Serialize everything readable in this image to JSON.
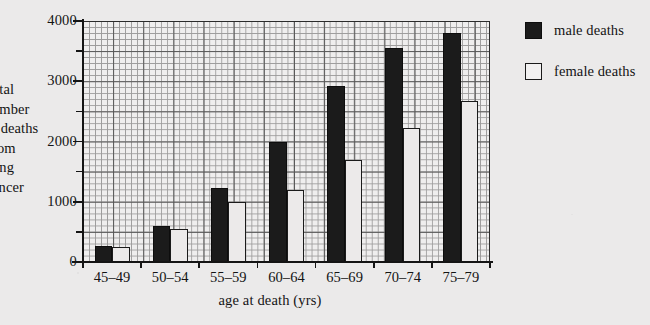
{
  "chart_data": {
    "type": "bar",
    "title": "",
    "xlabel": "age at death (yrs)",
    "ylabel": "total number of deaths from lung cancer",
    "ylabel_lines": [
      "otal",
      "umber",
      "f deaths",
      "rom",
      "ung",
      "ancer"
    ],
    "ylabel_note": "left edge of caption is cropped by the page margin",
    "categories": [
      "45–49",
      "50–54",
      "55–59",
      "60–64",
      "65–69",
      "70–74",
      "75–79"
    ],
    "series": [
      {
        "name": "male deaths",
        "color": "#1b1b1b",
        "values": [
          260,
          600,
          1220,
          2000,
          2920,
          3560,
          3800
        ]
      },
      {
        "name": "female deaths",
        "color": "#ffffff",
        "values": [
          250,
          540,
          1000,
          1200,
          1700,
          2220,
          2680
        ]
      }
    ],
    "ylim": [
      0,
      4000
    ],
    "ytick_labels": [
      "0",
      "1000",
      "2000",
      "3000",
      "4000"
    ],
    "ytick_values": [
      0,
      1000,
      2000,
      3000,
      4000
    ],
    "yminor_values": [
      500,
      1500,
      2500,
      3500
    ],
    "grid": true,
    "grid_style": "graph paper, minor squares of 100 units, major lines every 500 units",
    "legend_position": "right",
    "legend": [
      {
        "label": "male deaths",
        "swatch": "filled-black-square"
      },
      {
        "label": "female deaths",
        "swatch": "outlined-white-square"
      }
    ]
  },
  "colors": {
    "page_background": "#ebeaea",
    "plot_background": "#efeeee",
    "ink": "#141414",
    "grid_major": "#3c3c3c",
    "grid_minor": "#8e8d8d",
    "male_bar": "#1b1b1b",
    "female_bar": "#eceaea"
  }
}
